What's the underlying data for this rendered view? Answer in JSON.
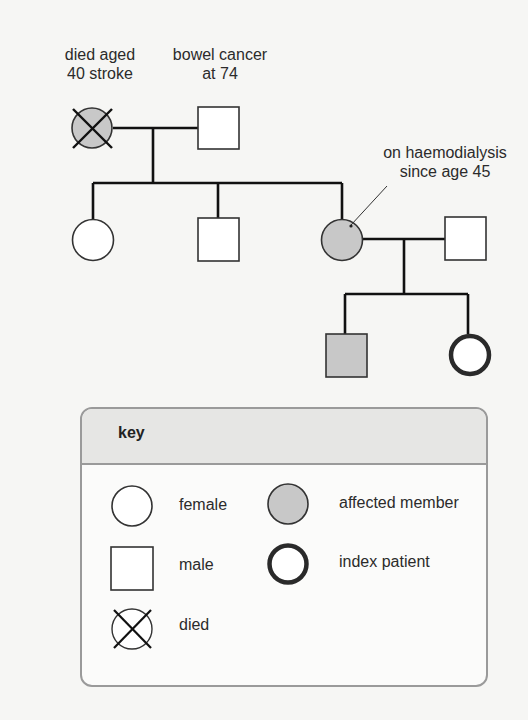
{
  "annotations": {
    "grandmother": [
      "died aged",
      "40 stroke"
    ],
    "grandfather": [
      "bowel cancer",
      "at 74"
    ],
    "mother": [
      "on haemodialysis",
      "since age 45"
    ]
  },
  "pedigree": {
    "generation_1": [
      {
        "id": "grandmother",
        "sex": "female",
        "affected": true,
        "deceased": true
      },
      {
        "id": "grandfather",
        "sex": "male",
        "affected": false,
        "deceased": false
      }
    ],
    "generation_2": [
      {
        "id": "daughter-1",
        "sex": "female",
        "affected": false
      },
      {
        "id": "son-1",
        "sex": "male",
        "affected": false
      },
      {
        "id": "mother",
        "sex": "female",
        "affected": true
      },
      {
        "id": "father",
        "sex": "male",
        "affected": false
      }
    ],
    "generation_3": [
      {
        "id": "son",
        "sex": "male",
        "affected": true
      },
      {
        "id": "index-patient",
        "sex": "female",
        "affected": false,
        "index": true
      }
    ]
  },
  "key": {
    "title": "key",
    "items": [
      {
        "symbol": "circle",
        "label": "female"
      },
      {
        "symbol": "square",
        "label": "male"
      },
      {
        "symbol": "crossed-circle",
        "label": "died"
      },
      {
        "symbol": "shaded-circle",
        "label": "affected member"
      },
      {
        "symbol": "double-circle",
        "label": "index patient"
      }
    ]
  },
  "colors": {
    "affected_fill": "#c8c8c8",
    "line": "#111111",
    "key_header": "#e6e6e4",
    "key_border": "#9a9a9a"
  }
}
